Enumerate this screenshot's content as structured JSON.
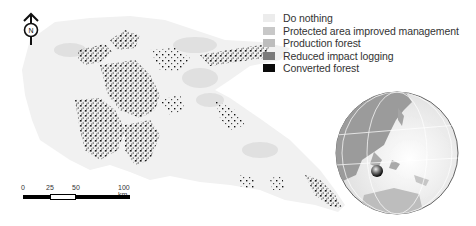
{
  "legend": {
    "items": [
      {
        "label": "Do nothing",
        "color": "#ececec"
      },
      {
        "label": "Protected area improved management",
        "color": "#c8c8c8"
      },
      {
        "label": "Production forest",
        "color": "#bdbdbd"
      },
      {
        "label": "Reduced impact logging",
        "color": "#7a7a7a"
      },
      {
        "label": "Converted forest",
        "color": "#0a0a0a"
      }
    ]
  },
  "north_arrow": {
    "label": "N"
  },
  "scale_bar": {
    "ticks": [
      "0",
      "25",
      "50",
      "100 km"
    ]
  },
  "inset": {
    "description": "Globe locator centered on Southeast Asia / Western Pacific with marker on Borneo"
  }
}
